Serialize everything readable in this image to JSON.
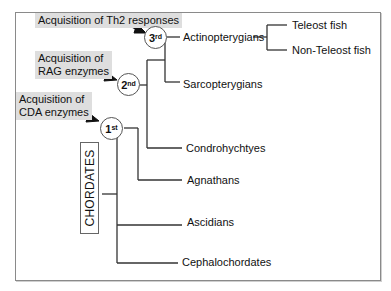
{
  "diagram": {
    "type": "phylogenetic-tree",
    "callouts": [
      {
        "id": "th2",
        "text": "Acquisition of Th2 responses",
        "node": "3rd"
      },
      {
        "id": "rag",
        "text": "Acquisition of\nRAG enzymes",
        "node": "2nd"
      },
      {
        "id": "cda",
        "text": "Acquisition of\nCDA enzymes",
        "node": "1st"
      }
    ],
    "nodes": [
      {
        "id": "n3",
        "base": "3",
        "sup": "rd"
      },
      {
        "id": "n2",
        "base": "2",
        "sup": "nd"
      },
      {
        "id": "n1",
        "base": "1",
        "sup": "st"
      }
    ],
    "root_label": "CHORDATES",
    "taxa": {
      "actinopterygians": "Actinopterygians",
      "teleost": "Teleost fish",
      "non_teleost": "Non-Teleost fish",
      "sarcopterygians": "Sarcopterygians",
      "condrohychtyes": "Condrohychtyes",
      "agnathans": "Agnathans",
      "ascidians": "Ascidians",
      "cephalochordates": "Cephalochordates"
    },
    "colors": {
      "line": "#333333",
      "callout_bg": "#dedede",
      "arrow": "#111111",
      "frame": "#8a8a8a"
    }
  }
}
